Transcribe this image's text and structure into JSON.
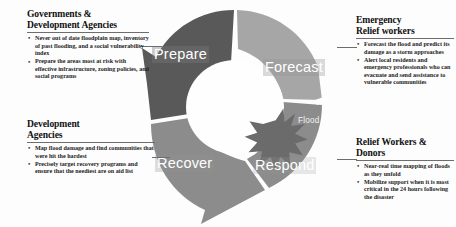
{
  "diagram": {
    "colors": {
      "prepare": "#595959",
      "forecast": "#a6a6a6",
      "respond": "#8c8c8c",
      "recover": "#8c8c8c",
      "flood_star": "#6b6b6b",
      "hub": "#ffffff",
      "rule": "#6d6d6d"
    },
    "segments": [
      {
        "id": "prepare",
        "label": "Prepare",
        "position": "top-left"
      },
      {
        "id": "forecast",
        "label": "Forecast",
        "position": "top-right"
      },
      {
        "id": "respond",
        "label": "Respond",
        "position": "bottom-right"
      },
      {
        "id": "recover",
        "label": "Recover",
        "position": "bottom-left"
      }
    ],
    "event": {
      "id": "flood",
      "label": "Flood",
      "shape": "starburst",
      "position": "right"
    }
  },
  "blocks": {
    "governments": {
      "heading": "Governments &\nDevelopment Agencies",
      "bullets": [
        "Never out of date floodplain map, inventory of past flooding, and a social vulnerability index",
        "Prepare the areas most at risk with effective infrastructure, zoning policies, and social programs"
      ]
    },
    "development": {
      "heading": "Development\nAgencies",
      "bullets": [
        "Map flood damage and find communities that were hit the hardest",
        "Precisely target recovery programs and ensure that the neediest are on aid list"
      ]
    },
    "emergency": {
      "heading": "Emergency\nRelief workers",
      "bullets": [
        "Forecast the flood and predict its damage as a storm approaches",
        "Alert local residents and emergency professionals who can evacuate and send assistance to vulnerable communities"
      ]
    },
    "relief": {
      "heading": "Relief Workers &\nDonors",
      "bullets": [
        "Near-real time mapping of floods as they unfold",
        "Mobilize support when it is most critical in the 24 hours following the disaster"
      ]
    }
  },
  "bullet_glyph": "•"
}
